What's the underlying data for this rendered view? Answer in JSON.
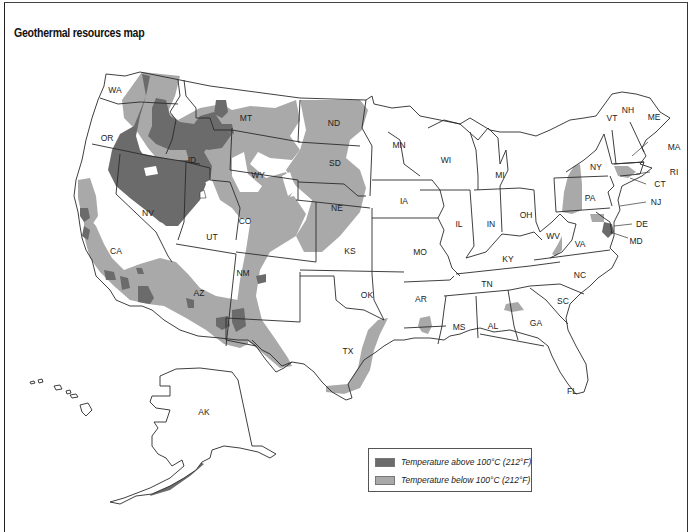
{
  "title": "Geothermal resources map",
  "legend": {
    "items": [
      {
        "label": "Temperature above 100°C (212°F)",
        "color": "#6b6b6b"
      },
      {
        "label": "Temperature below 100°C (212°F)",
        "color": "#a9a9a9"
      }
    ]
  },
  "states": {
    "WA": "WA",
    "OR": "OR",
    "CA": "CA",
    "NV": "NV",
    "ID": "ID",
    "MT": "MT",
    "WY": "WY",
    "UT": "UT",
    "CO": "CO",
    "AZ": "AZ",
    "NM": "NM",
    "ND": "ND",
    "SD": "SD",
    "NE": "NE",
    "KS": "KS",
    "OK": "OK",
    "TX": "TX",
    "MN": "MN",
    "IA": "IA",
    "MO": "MO",
    "AR": "AR",
    "WI": "WI",
    "IL": "IL",
    "MI": "MI",
    "IN": "IN",
    "OH": "OH",
    "KY": "KY",
    "TN": "TN",
    "MS": "MS",
    "AL": "AL",
    "GA": "GA",
    "FL": "FL",
    "SC": "SC",
    "NC": "NC",
    "VA": "VA",
    "WV": "WV",
    "PA": "PA",
    "NY": "NY",
    "VT": "VT",
    "NH": "NH",
    "ME": "ME",
    "MA": "MA",
    "RI": "RI",
    "CT": "CT",
    "NJ": "NJ",
    "DE": "DE",
    "MD": "MD",
    "AK": "AK"
  },
  "colors": {
    "high_temp": "#6b6b6b",
    "low_temp": "#a9a9a9",
    "state_fill": "#ffffff",
    "border": "#2a2a2a"
  }
}
